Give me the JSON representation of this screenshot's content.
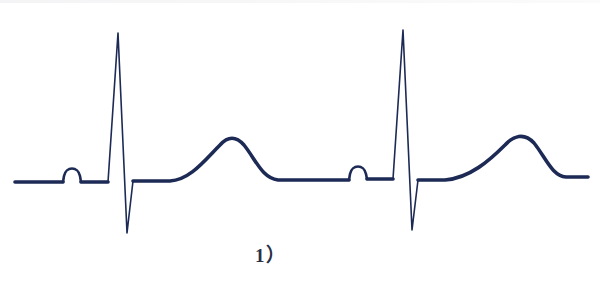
{
  "figure": {
    "caption": "1）",
    "stroke_color": "#1c2a55",
    "background_color": "#ffffff"
  },
  "waveform": {
    "cycles": [
      {
        "baseline_start": [
          15,
          182
        ],
        "p_wave": {
          "start": [
            63,
            182
          ],
          "peak": [
            72,
            168
          ],
          "end": [
            82,
            182
          ]
        },
        "qrs": {
          "q": [
            108,
            182
          ],
          "r_peak": [
            118,
            33
          ],
          "s_trough": [
            127,
            233
          ],
          "return": [
            133,
            181
          ]
        },
        "t_wave": {
          "start": [
            172,
            180
          ],
          "peak": [
            231,
            137
          ],
          "end": [
            275,
            180
          ]
        }
      },
      {
        "baseline_start": [
          275,
          180
        ],
        "p_wave": {
          "start": [
            349,
            179
          ],
          "peak": [
            358,
            165
          ],
          "end": [
            367,
            179
          ]
        },
        "qrs": {
          "q": [
            393,
            179
          ],
          "r_peak": [
            403,
            30
          ],
          "s_trough": [
            412,
            230
          ],
          "return": [
            418,
            180
          ]
        },
        "t_wave": {
          "start": [
            445,
            179
          ],
          "peak": [
            519,
            135
          ],
          "end": [
            562,
            177
          ]
        },
        "baseline_end": [
          588,
          177
        ]
      }
    ]
  }
}
